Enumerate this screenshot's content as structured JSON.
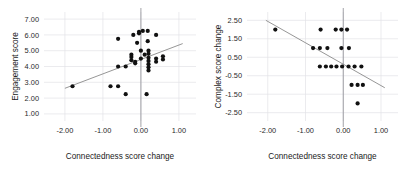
{
  "figure": {
    "background": "#ffffff",
    "dot_color": "#111111",
    "trendline_color": "#8a8a8a",
    "gridline_color": "#e3e3e6",
    "zeroline_color": "#8b8b92"
  },
  "chart_data": [
    {
      "id": "engagement-vs-connectedness",
      "type": "scatter",
      "title": "",
      "xlabel": "Connectedness score change",
      "ylabel": "Engagement score",
      "xlim": [
        -2.55,
        1.45
      ],
      "ylim": [
        0.55,
        7.45
      ],
      "xticks": [
        -2.0,
        -1.0,
        0.0,
        1.0
      ],
      "xtick_labels": [
        "-2.00",
        "-1.00",
        "0.00",
        "1.00"
      ],
      "yticks": [
        1.0,
        2.0,
        3.0,
        4.0,
        5.0,
        6.0,
        7.0
      ],
      "ytick_labels": [
        "1.00",
        "2.00",
        "3.00",
        "4.00",
        "5.00",
        "6.00",
        "7.00"
      ],
      "grid": true,
      "legend": "none",
      "zero_vline": 0.0,
      "trendline": {
        "x0": -2.0,
        "y0": 2.62,
        "x1": 1.1,
        "y1": 5.45
      },
      "points": [
        {
          "x": -1.8,
          "y": 2.75
        },
        {
          "x": -0.8,
          "y": 2.75
        },
        {
          "x": -0.6,
          "y": 2.75
        },
        {
          "x": -0.6,
          "y": 5.75
        },
        {
          "x": -0.6,
          "y": 4.0
        },
        {
          "x": -0.4,
          "y": 4.0
        },
        {
          "x": -0.4,
          "y": 2.25
        },
        {
          "x": -0.25,
          "y": 4.75
        },
        {
          "x": -0.25,
          "y": 4.6
        },
        {
          "x": -0.25,
          "y": 4.4
        },
        {
          "x": -0.2,
          "y": 6.0
        },
        {
          "x": -0.15,
          "y": 4.3
        },
        {
          "x": -0.15,
          "y": 4.2
        },
        {
          "x": -0.1,
          "y": 5.5
        },
        {
          "x": -0.05,
          "y": 6.2
        },
        {
          "x": -0.05,
          "y": 6.1
        },
        {
          "x": 0.0,
          "y": 5.0
        },
        {
          "x": 0.0,
          "y": 4.5
        },
        {
          "x": 0.05,
          "y": 6.25
        },
        {
          "x": 0.1,
          "y": 4.75
        },
        {
          "x": 0.15,
          "y": 2.25
        },
        {
          "x": 0.18,
          "y": 6.25
        },
        {
          "x": 0.18,
          "y": 5.6
        },
        {
          "x": 0.2,
          "y": 5.0
        },
        {
          "x": 0.2,
          "y": 4.8
        },
        {
          "x": 0.2,
          "y": 4.55
        },
        {
          "x": 0.2,
          "y": 4.35
        },
        {
          "x": 0.2,
          "y": 4.15
        },
        {
          "x": 0.2,
          "y": 3.95
        },
        {
          "x": 0.2,
          "y": 3.75
        },
        {
          "x": 0.4,
          "y": 6.0
        },
        {
          "x": 0.4,
          "y": 4.5
        },
        {
          "x": 0.4,
          "y": 4.3
        },
        {
          "x": 0.58,
          "y": 4.65
        },
        {
          "x": 0.58,
          "y": 4.45
        }
      ]
    },
    {
      "id": "complex-vs-connectedness",
      "type": "scatter",
      "title": "",
      "xlabel": "Connectedness score change",
      "ylabel": "Complex score change",
      "xlim": [
        -2.55,
        1.45
      ],
      "ylim": [
        -2.95,
        2.95
      ],
      "xticks": [
        -2.0,
        -1.0,
        0.0,
        1.0
      ],
      "xtick_labels": [
        "-2.00",
        "-1.00",
        "0.00",
        "1.00"
      ],
      "yticks": [
        -2.5,
        -1.5,
        -0.5,
        0.5,
        1.5,
        2.5
      ],
      "ytick_labels": [
        "-2.50",
        "-1.50",
        "-0.50",
        "0.50",
        "1.50",
        "2.50"
      ],
      "grid": true,
      "legend": "none",
      "zero_vline": 0.0,
      "trendline": {
        "x0": -2.05,
        "y0": 2.5,
        "x1": 1.1,
        "y1": -1.15
      },
      "points": [
        {
          "x": -1.8,
          "y": 2.0
        },
        {
          "x": -0.6,
          "y": 2.0
        },
        {
          "x": -0.2,
          "y": 2.0
        },
        {
          "x": -0.05,
          "y": 2.0
        },
        {
          "x": 0.1,
          "y": 2.0
        },
        {
          "x": -0.8,
          "y": 1.0
        },
        {
          "x": -0.62,
          "y": 1.0
        },
        {
          "x": -0.42,
          "y": 1.0
        },
        {
          "x": -0.05,
          "y": 1.0
        },
        {
          "x": 0.15,
          "y": 1.0
        },
        {
          "x": -0.62,
          "y": 0.0
        },
        {
          "x": -0.46,
          "y": 0.0
        },
        {
          "x": -0.32,
          "y": 0.0
        },
        {
          "x": -0.18,
          "y": 0.0
        },
        {
          "x": -0.03,
          "y": 0.0
        },
        {
          "x": 0.14,
          "y": 0.0
        },
        {
          "x": 0.3,
          "y": 0.0
        },
        {
          "x": 0.48,
          "y": 0.0
        },
        {
          "x": 0.22,
          "y": -1.0
        },
        {
          "x": 0.38,
          "y": -1.0
        },
        {
          "x": 0.52,
          "y": -1.0
        },
        {
          "x": 0.38,
          "y": -2.0
        }
      ]
    }
  ]
}
